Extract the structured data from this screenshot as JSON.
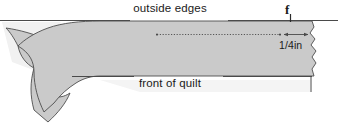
{
  "diagram": {
    "colors": {
      "fabric_fill": "#cacaca",
      "fabric_stroke": "#4d4d4d",
      "line": "#4a4a4a",
      "text": "#1a1a1a",
      "background": "#ffffff"
    },
    "labels": {
      "outside_edges": "outside edges",
      "front_of_quilt": "front of quilt",
      "measurement": "1/4in",
      "fold_marker": "f"
    },
    "guides": {
      "top_line_label": "outside-edges-guide-line",
      "bottom_line_label": "front-of-quilt-guide-line",
      "measurement_arrow_label": "seam-allowance-dotted-arrow",
      "dimension_arrow_label": "quarter-inch-dimension-arrow"
    }
  }
}
